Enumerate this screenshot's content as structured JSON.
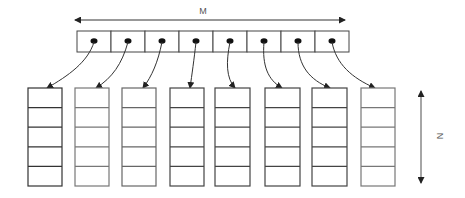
{
  "diagram": {
    "labels": {
      "width_label": "M",
      "height_label": "N"
    },
    "top_array": {
      "cell_count": 8,
      "x": 77,
      "y": 31,
      "cell_width": 34,
      "cell_height": 21
    },
    "columns": {
      "count": 8,
      "x_positions": [
        28,
        75,
        122,
        170,
        215,
        265,
        312,
        361
      ],
      "y": 88,
      "width": 34,
      "cell_height": 19.6,
      "cells_per_column": 5
    },
    "colors": {
      "stroke": "#333333",
      "column_stroke_light": "#777777",
      "arrow_gray": "#888888",
      "label": "#555555"
    }
  }
}
